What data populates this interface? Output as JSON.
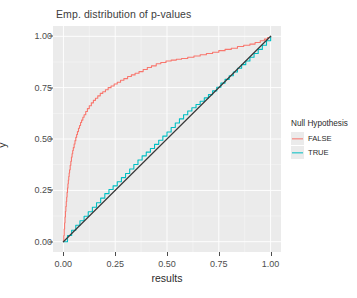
{
  "chart_data": {
    "type": "line",
    "title": "Emp. distribution of p-values",
    "xlabel": "results",
    "ylabel": "y",
    "xlim": [
      -0.05,
      1.05
    ],
    "ylim": [
      -0.05,
      1.05
    ],
    "grid": true,
    "legend_position": "right",
    "legend_title": "Null Hypothesis",
    "panel_background": "#ebebeb",
    "grid_color": "#ffffff",
    "xticks": [
      "0.00",
      "0.25",
      "0.50",
      "0.75",
      "1.00"
    ],
    "xtick_values": [
      0.0,
      0.25,
      0.5,
      0.75,
      1.0
    ],
    "yticks": [
      "0.00",
      "0.25",
      "0.50",
      "0.75",
      "1.00"
    ],
    "ytick_values": [
      0.0,
      0.25,
      0.5,
      0.75,
      1.0
    ],
    "series": [
      {
        "name": "FALSE",
        "color": "#f8766d",
        "description": "Empirical CDF of p-values when null hypothesis is false; rises steeply near 0 then plateaus near 1.",
        "x": [
          0.0,
          0.002,
          0.004,
          0.006,
          0.008,
          0.01,
          0.012,
          0.014,
          0.016,
          0.018,
          0.02,
          0.022,
          0.024,
          0.026,
          0.028,
          0.03,
          0.033,
          0.036,
          0.039,
          0.042,
          0.045,
          0.048,
          0.052,
          0.056,
          0.06,
          0.064,
          0.068,
          0.073,
          0.078,
          0.083,
          0.088,
          0.094,
          0.1,
          0.108,
          0.116,
          0.125,
          0.135,
          0.145,
          0.155,
          0.166,
          0.178,
          0.19,
          0.203,
          0.216,
          0.23,
          0.245,
          0.26,
          0.276,
          0.292,
          0.31,
          0.328,
          0.346,
          0.365,
          0.385,
          0.405,
          0.425,
          0.448,
          0.47,
          0.495,
          0.52,
          0.545,
          0.57,
          0.6,
          0.63,
          0.66,
          0.69,
          0.72,
          0.75,
          0.78,
          0.81,
          0.84,
          0.87,
          0.9,
          0.925,
          0.95,
          0.97,
          0.985,
          1.0
        ],
        "y": [
          0.0,
          0.03,
          0.062,
          0.092,
          0.12,
          0.148,
          0.172,
          0.196,
          0.218,
          0.24,
          0.262,
          0.282,
          0.3,
          0.318,
          0.334,
          0.35,
          0.372,
          0.392,
          0.412,
          0.428,
          0.444,
          0.458,
          0.476,
          0.492,
          0.508,
          0.522,
          0.536,
          0.552,
          0.566,
          0.58,
          0.592,
          0.606,
          0.618,
          0.634,
          0.648,
          0.662,
          0.676,
          0.688,
          0.698,
          0.71,
          0.722,
          0.73,
          0.74,
          0.75,
          0.758,
          0.768,
          0.776,
          0.786,
          0.794,
          0.804,
          0.812,
          0.82,
          0.828,
          0.838,
          0.848,
          0.856,
          0.866,
          0.872,
          0.88,
          0.884,
          0.888,
          0.892,
          0.898,
          0.904,
          0.91,
          0.916,
          0.922,
          0.93,
          0.936,
          0.942,
          0.95,
          0.956,
          0.962,
          0.97,
          0.978,
          0.986,
          0.994,
          1.0
        ]
      },
      {
        "name": "TRUE",
        "color": "#00bfc4",
        "description": "Empirical CDF of p-values when null hypothesis is true; approximately uniform, tracking the diagonal slightly above it.",
        "x": [
          0.0,
          0.02,
          0.04,
          0.06,
          0.08,
          0.1,
          0.12,
          0.14,
          0.16,
          0.18,
          0.2,
          0.22,
          0.24,
          0.26,
          0.28,
          0.3,
          0.32,
          0.34,
          0.36,
          0.38,
          0.4,
          0.42,
          0.44,
          0.46,
          0.48,
          0.5,
          0.52,
          0.54,
          0.56,
          0.58,
          0.6,
          0.62,
          0.64,
          0.66,
          0.68,
          0.7,
          0.72,
          0.74,
          0.76,
          0.78,
          0.8,
          0.82,
          0.84,
          0.86,
          0.88,
          0.9,
          0.92,
          0.94,
          0.96,
          0.98,
          1.0
        ],
        "y": [
          0.0,
          0.03,
          0.056,
          0.08,
          0.102,
          0.124,
          0.146,
          0.168,
          0.19,
          0.212,
          0.234,
          0.254,
          0.272,
          0.292,
          0.312,
          0.332,
          0.354,
          0.376,
          0.398,
          0.418,
          0.436,
          0.454,
          0.474,
          0.494,
          0.514,
          0.534,
          0.556,
          0.578,
          0.598,
          0.618,
          0.636,
          0.652,
          0.668,
          0.684,
          0.7,
          0.716,
          0.734,
          0.752,
          0.772,
          0.79,
          0.808,
          0.826,
          0.844,
          0.862,
          0.88,
          0.898,
          0.916,
          0.936,
          0.956,
          0.978,
          1.0
        ]
      }
    ],
    "reference_line": {
      "name": "diagonal",
      "color": "#3a3a3a",
      "from": [
        0.0,
        0.0
      ],
      "to": [
        1.0,
        1.0
      ]
    }
  },
  "legend": {
    "title": "Null Hypothesis",
    "items": [
      {
        "label": "FALSE",
        "color": "#f8766d"
      },
      {
        "label": "TRUE",
        "color": "#00bfc4"
      }
    ]
  }
}
